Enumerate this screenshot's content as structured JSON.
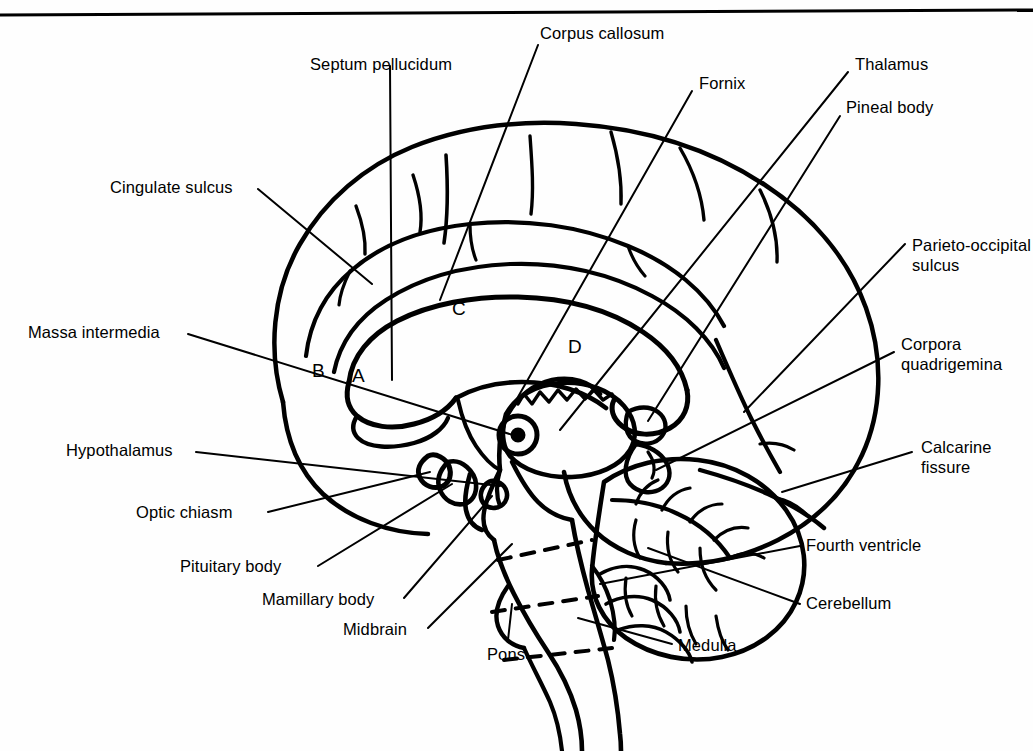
{
  "figure": {
    "type": "anatomical-diagram",
    "top_rule": true,
    "ink_color": "#000000",
    "background_color": "#ffffff"
  },
  "labels": {
    "cingulate_sulcus": "Cingulate sulcus",
    "septum_pellucidum": "Septum pellucidum",
    "corpus_callosum": "Corpus callosum",
    "fornix": "Fornix",
    "thalamus": "Thalamus",
    "pineal_body": "Pineal body",
    "parieto_occipital_sulcus_1": "Parieto-occipital",
    "parieto_occipital_sulcus_2": "sulcus",
    "massa_intermedia": "Massa intermedia",
    "corpora_quadrigemina_1": "Corpora",
    "corpora_quadrigemina_2": "quadrigemina",
    "hypothalamus": "Hypothalamus",
    "calcarine_fissure_1": "Calcarine",
    "calcarine_fissure_2": "fissure",
    "optic_chiasm": "Optic chiasm",
    "pituitary_body": "Pituitary body",
    "fourth_ventricle": "Fourth ventricle",
    "mamillary_body": "Mamillary body",
    "cerebellum": "Cerebellum",
    "midbrain": "Midbrain",
    "pons": "Pons",
    "medulla": "Medulla"
  },
  "region_letters": {
    "a": "A",
    "b": "B",
    "c": "C",
    "d": "D"
  }
}
